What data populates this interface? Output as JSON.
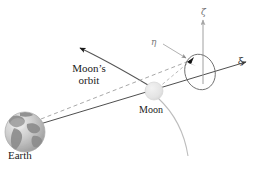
{
  "figure": {
    "background_color": "#ffffff"
  },
  "bodies": {
    "earth": {
      "label": "Earth",
      "cx": 25,
      "cy": 132,
      "r": 20,
      "ocean_color": "#c9c9c9",
      "land_color": "#8e8e8e",
      "highlight_color": "#e8e8e8"
    },
    "moon": {
      "label": "Moon",
      "cx": 154,
      "cy": 91,
      "r": 9,
      "fill_color": "#e3e3e3",
      "edge_color": "#d2d2d2"
    }
  },
  "axes": {
    "xi": {
      "label": "ξ",
      "color": "#3a3a3a",
      "direction": "right-up"
    },
    "eta": {
      "label": "η",
      "color": "#8a8a8a",
      "direction": "into-page"
    },
    "zeta": {
      "label": "ζ",
      "color": "#9a9a9a",
      "direction": "up"
    }
  },
  "orbit": {
    "label_line1": "Moon’s",
    "label_line2": "orbit",
    "curve_color": "#555555",
    "arrow_color": "#1a1a1a",
    "trailing_arc_color": "#b9b9b9"
  },
  "lines": {
    "sight_line_solid_color": "#4a4a4a",
    "sight_line_dashed_color": "#9b9b9b",
    "ellipse_color": "#6f6f6f",
    "marker_color": "#1a1a1a"
  }
}
